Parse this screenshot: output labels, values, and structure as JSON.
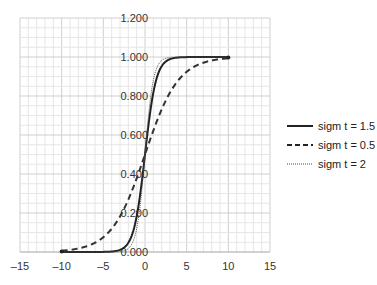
{
  "chart_data": {
    "type": "line",
    "title": "",
    "xlabel": "",
    "ylabel": "",
    "xlim": [
      -15,
      15
    ],
    "ylim": [
      0,
      1.2
    ],
    "x_ticks": [
      "-15",
      "-10",
      "-5",
      "0",
      "5",
      "10",
      "15"
    ],
    "y_ticks": [
      "0.000",
      "0.200",
      "0.400",
      "0.600",
      "0.800",
      "1.000",
      "1.200"
    ],
    "grid": true,
    "legend_position": "right",
    "x_range_of_data": [
      -10,
      10
    ],
    "series": [
      {
        "name": "sigm t = 1.5",
        "gain": 1.5,
        "style": "solid",
        "x": [
          -10,
          -5,
          -3,
          -2,
          -1,
          0,
          1,
          2,
          3,
          5,
          10
        ],
        "y": [
          0.0,
          0.001,
          0.011,
          0.047,
          0.182,
          0.5,
          0.818,
          0.953,
          0.989,
          0.999,
          1.0
        ]
      },
      {
        "name": "sigm t = 0.5",
        "gain": 0.5,
        "style": "dashed",
        "x": [
          -10,
          -5,
          -3,
          -2,
          -1,
          0,
          1,
          2,
          3,
          5,
          10
        ],
        "y": [
          0.007,
          0.076,
          0.182,
          0.269,
          0.378,
          0.5,
          0.622,
          0.731,
          0.818,
          0.924,
          0.993
        ]
      },
      {
        "name": "sigm t = 2",
        "gain": 2,
        "style": "dotted",
        "x": [
          -10,
          -5,
          -3,
          -2,
          -1,
          0,
          1,
          2,
          3,
          5,
          10
        ],
        "y": [
          0.0,
          0.0,
          0.002,
          0.018,
          0.119,
          0.5,
          0.881,
          0.982,
          0.998,
          1.0,
          1.0
        ]
      }
    ]
  },
  "legend": {
    "items": [
      {
        "label": "sigm t = 1.5"
      },
      {
        "label": "sigm t = 0.5"
      },
      {
        "label": "sigm t = 2"
      }
    ]
  }
}
